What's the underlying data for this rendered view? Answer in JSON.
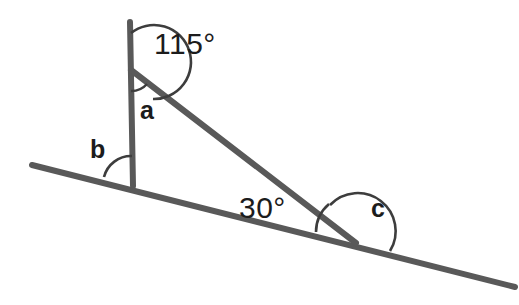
{
  "diagram": {
    "colors": {
      "line": "#595959",
      "arc": "#3d3d3d",
      "text": "#1c1c1c",
      "background": "#ffffff"
    },
    "labels": {
      "angle_115": "115°",
      "angle_a": "a",
      "angle_b": "b",
      "angle_30": "30°",
      "angle_c": "c"
    },
    "lines": [
      {
        "name": "vertical-line",
        "x1": 131,
        "y1": 22,
        "x2": 133,
        "y2": 186
      },
      {
        "name": "slanted-transversal-line",
        "x1": 32,
        "y1": 165,
        "x2": 515,
        "y2": 287
      },
      {
        "name": "triangle-hypotenuse",
        "x1": 131,
        "y1": 70,
        "x2": 356,
        "y2": 243
      }
    ],
    "arcs": [
      {
        "name": "arc-115",
        "radius": 37
      },
      {
        "name": "arc-a",
        "radius": 21
      },
      {
        "name": "arc-b",
        "radius": 28
      },
      {
        "name": "arc-30",
        "radius": 37
      },
      {
        "name": "arc-c",
        "radius": 38
      }
    ]
  }
}
